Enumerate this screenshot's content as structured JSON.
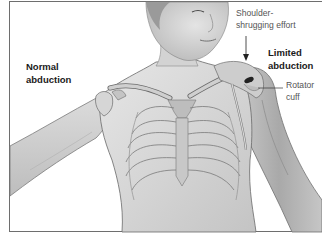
{
  "figure": {
    "labels": {
      "normal_abduction": [
        "Normal",
        "abduction"
      ],
      "shoulder_shrugging": [
        "Shoulder-",
        "shrugging effort"
      ],
      "limited_abduction": [
        "Limited",
        "abduction"
      ],
      "rotator_cuff": [
        "Rotator",
        "cuff"
      ]
    },
    "icons": {
      "arrow": "down-arrow-pointer",
      "leader": "leader-line"
    },
    "colors": {
      "background": "#ffffff",
      "frame": "#6e6e6e",
      "skin": "#d9d9d9",
      "skin_shadow": "#a8a8a8",
      "bone": "#c8c8c8",
      "outline": "#6a6a6a",
      "label_text": "#1a1a1a",
      "annotation_text": "#555555"
    }
  }
}
